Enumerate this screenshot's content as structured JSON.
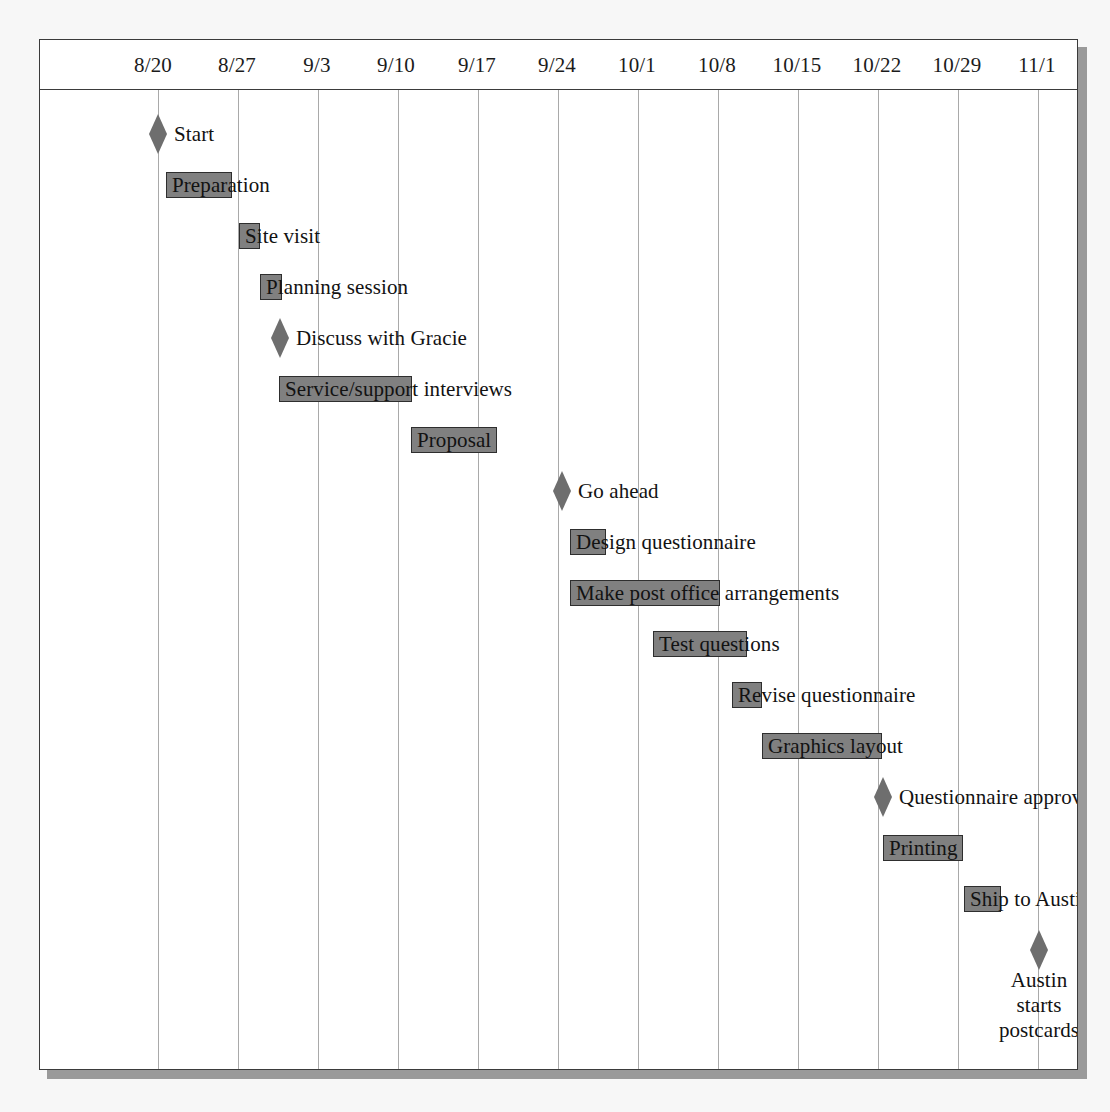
{
  "chart_data": {
    "type": "bar",
    "chart_kind": "gantt",
    "title": "",
    "xlabel": "",
    "ylabel": "",
    "grid": true,
    "legend": null,
    "axis": {
      "tick_labels": [
        "8/20",
        "8/27",
        "9/3",
        "9/10",
        "9/17",
        "9/24",
        "10/1",
        "10/8",
        "10/15",
        "10/22",
        "10/29",
        "11/1"
      ],
      "tick_positions_px": [
        118,
        198,
        278,
        358,
        438,
        518,
        598,
        678,
        758,
        838,
        918,
        998
      ],
      "label_positions_px": [
        113,
        197,
        277,
        356,
        437,
        517,
        597,
        677,
        757,
        837,
        917,
        997
      ]
    },
    "colors": {
      "bar_fill": "#808080",
      "bar_border": "#2e2e2e",
      "milestone_fill": "#6e6e6e",
      "gridline": "#a9a9a9",
      "frame": "#3b3b3b",
      "page_background": "#f7f7f7",
      "plot_background": "#ffffff",
      "text": "#121212"
    },
    "tasks": [
      {
        "name": "Start",
        "kind": "milestone",
        "point_px": 118,
        "label_side": "right",
        "row": 0
      },
      {
        "name": "Preparation",
        "kind": "bar",
        "start_px": 126,
        "end_px": 192,
        "label_side": "inside",
        "row": 1
      },
      {
        "name": "Site visit",
        "kind": "bar",
        "start_px": 199,
        "end_px": 220,
        "label_side": "inside",
        "row": 2
      },
      {
        "name": "Planning session",
        "kind": "bar",
        "start_px": 220,
        "end_px": 242,
        "label_side": "inside",
        "row": 3
      },
      {
        "name": "Discuss with Gracie",
        "kind": "milestone",
        "point_px": 240,
        "label_side": "right",
        "row": 4
      },
      {
        "name": "Service/support interviews",
        "kind": "bar",
        "start_px": 239,
        "end_px": 372,
        "label_side": "inside",
        "row": 5
      },
      {
        "name": "Proposal",
        "kind": "bar",
        "start_px": 371,
        "end_px": 457,
        "label_side": "inside",
        "row": 6
      },
      {
        "name": "Go ahead",
        "kind": "milestone",
        "point_px": 522,
        "label_side": "right",
        "row": 7
      },
      {
        "name": "Design questionnaire",
        "kind": "bar",
        "start_px": 530,
        "end_px": 566,
        "label_side": "inside",
        "row": 8
      },
      {
        "name": "Make post office arrangements",
        "kind": "bar",
        "start_px": 530,
        "end_px": 680,
        "label_side": "inside",
        "row": 9
      },
      {
        "name": "Test questions",
        "kind": "bar",
        "start_px": 613,
        "end_px": 707,
        "label_side": "inside",
        "row": 10
      },
      {
        "name": "Revise questionnaire",
        "kind": "bar",
        "start_px": 692,
        "end_px": 722,
        "label_side": "inside",
        "row": 11
      },
      {
        "name": "Graphics layout",
        "kind": "bar",
        "start_px": 722,
        "end_px": 842,
        "label_side": "inside",
        "row": 12
      },
      {
        "name": "Questionnaire approval",
        "kind": "milestone",
        "point_px": 843,
        "label_side": "right",
        "row": 13
      },
      {
        "name": "Printing",
        "kind": "bar",
        "start_px": 843,
        "end_px": 923,
        "label_side": "inside",
        "row": 14
      },
      {
        "name": "Ship to Austin",
        "kind": "bar",
        "start_px": 924,
        "end_px": 961,
        "label_side": "inside",
        "row": 15
      },
      {
        "name": "Austin starts\npostcards",
        "kind": "milestone",
        "point_px": 999,
        "label_side": "below",
        "row": 16
      }
    ]
  }
}
